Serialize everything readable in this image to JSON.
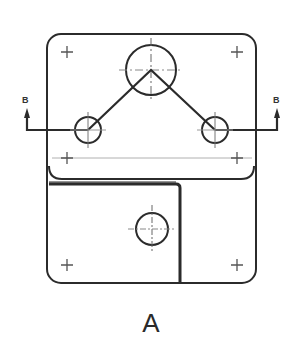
{
  "drawing": {
    "view_label": "A",
    "section_label_left": "B",
    "section_label_right": "B",
    "line_color": "#2b2b2b",
    "hidden_line_color": "#9a9a9a"
  },
  "features": {
    "outer_frame": {
      "x": 47,
      "y": 34,
      "width": 209,
      "height": 249,
      "corner_radius": 14
    },
    "top_plate": {
      "x": 49,
      "y": 34,
      "width": 205,
      "height": 145
    },
    "large_hole": {
      "cx": 151,
      "cy": 70,
      "r": 25
    },
    "small_holes": [
      {
        "cx": 88,
        "cy": 130,
        "r": 13
      },
      {
        "cx": 215,
        "cy": 130,
        "r": 13
      }
    ],
    "bottom_hole": {
      "cx": 152,
      "cy": 229,
      "r": 16
    },
    "mount_points": [
      {
        "x": 67,
        "y": 52
      },
      {
        "x": 237,
        "y": 52
      },
      {
        "x": 67,
        "y": 158
      },
      {
        "x": 237,
        "y": 158
      },
      {
        "x": 67,
        "y": 265
      },
      {
        "x": 237,
        "y": 265
      }
    ]
  }
}
